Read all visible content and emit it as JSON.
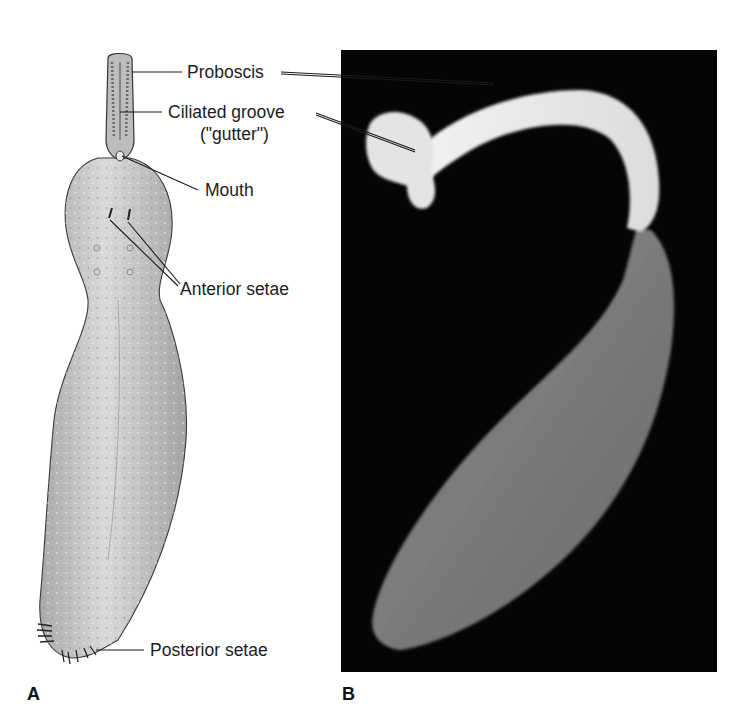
{
  "figure": {
    "panels": [
      {
        "id": "A",
        "letter": "A",
        "type": "illustration"
      },
      {
        "id": "B",
        "letter": "B",
        "type": "photograph"
      }
    ],
    "labels": {
      "proboscis": "Proboscis",
      "ciliated_groove_1": "Ciliated groove",
      "ciliated_groove_2": "(\"gutter\")",
      "mouth": "Mouth",
      "anterior_setae": "Anterior setae",
      "posterior_setae": "Posterior setae"
    },
    "colors": {
      "background": "#ffffff",
      "photo_background": "#050505",
      "body_fill": "#c9c9c9",
      "leader_line": "#1a1a1a"
    }
  }
}
